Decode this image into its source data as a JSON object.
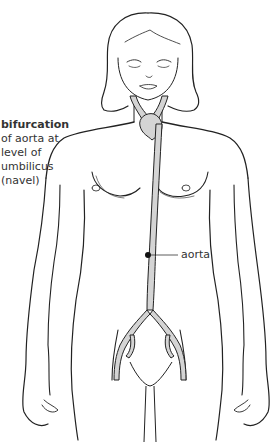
{
  "diagram": {
    "labels": {
      "bifurcation": {
        "title": "bifurcation",
        "lines": [
          "of aorta at",
          "level of",
          "umbilicus",
          "(navel)"
        ]
      },
      "aorta": "aorta"
    },
    "colors": {
      "ink": "#222222",
      "vessel_fill": "#d4d4d4",
      "text": "#333333",
      "background": "#ffffff"
    }
  }
}
